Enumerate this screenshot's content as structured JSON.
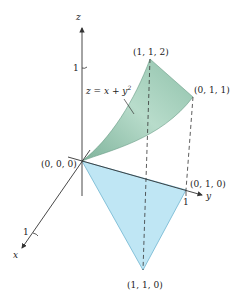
{
  "diagram": {
    "axes": {
      "x": "x",
      "y": "y",
      "z": "z"
    },
    "ticks": {
      "x": "1",
      "y": "1",
      "z": "1"
    },
    "surface_label": "z = x + y",
    "surface_label_exp": "2",
    "points": {
      "origin": "(0, 0, 0)",
      "p112": "(1, 1, 2)",
      "p011": "(0, 1, 1)",
      "p010": "(0, 1, 0)",
      "p110": "(1, 1, 0)"
    },
    "colors": {
      "surface": "#9cc9b4",
      "surface_light": "#c9e6da",
      "base_triangle": "#b9e3f2",
      "axis": "#333333"
    }
  }
}
